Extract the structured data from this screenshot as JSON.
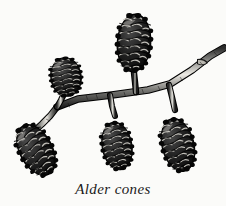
{
  "figure": {
    "kind": "botanical-line-illustration",
    "subject": "Alder cones",
    "caption": "Alder cones",
    "medium": "black and white pen-and-ink engraving",
    "background_color": "#fbfbf9",
    "ink_color": "#111111",
    "midtone_color": "#6b6b6b",
    "highlight_color": "#e8e8e4",
    "canvas": {
      "width": 226,
      "height": 206
    },
    "branch": {
      "name": "alder-twig",
      "description": "main woody twig running from lower-left fork up to the right edge, with a small lateral bud near the right tip",
      "tip_bud": "small lateral side bud at upper right",
      "nodes": 3
    },
    "cones": [
      {
        "id": "cone-upper-left",
        "label": "upright cone, upper left",
        "orientation": "upright",
        "center": {
          "x": 66,
          "y": 77
        },
        "width": 31,
        "height": 39,
        "rotation_deg": -8
      },
      {
        "id": "cone-top-center",
        "label": "large upright cone, top center",
        "orientation": "upright",
        "center": {
          "x": 134,
          "y": 43
        },
        "width": 34,
        "height": 58,
        "rotation_deg": 4
      },
      {
        "id": "cone-lower-left",
        "label": "hanging cone, lower left",
        "orientation": "pendant",
        "center": {
          "x": 36,
          "y": 150
        },
        "width": 33,
        "height": 55,
        "rotation_deg": -28
      },
      {
        "id": "cone-lower-center",
        "label": "hanging cone, lower center",
        "orientation": "pendant",
        "center": {
          "x": 117,
          "y": 146
        },
        "width": 30,
        "height": 48,
        "rotation_deg": -10
      },
      {
        "id": "cone-lower-right",
        "label": "hanging cone, lower right",
        "orientation": "pendant",
        "center": {
          "x": 178,
          "y": 145
        },
        "width": 32,
        "height": 54,
        "rotation_deg": -14
      }
    ],
    "cone_count": 5
  }
}
